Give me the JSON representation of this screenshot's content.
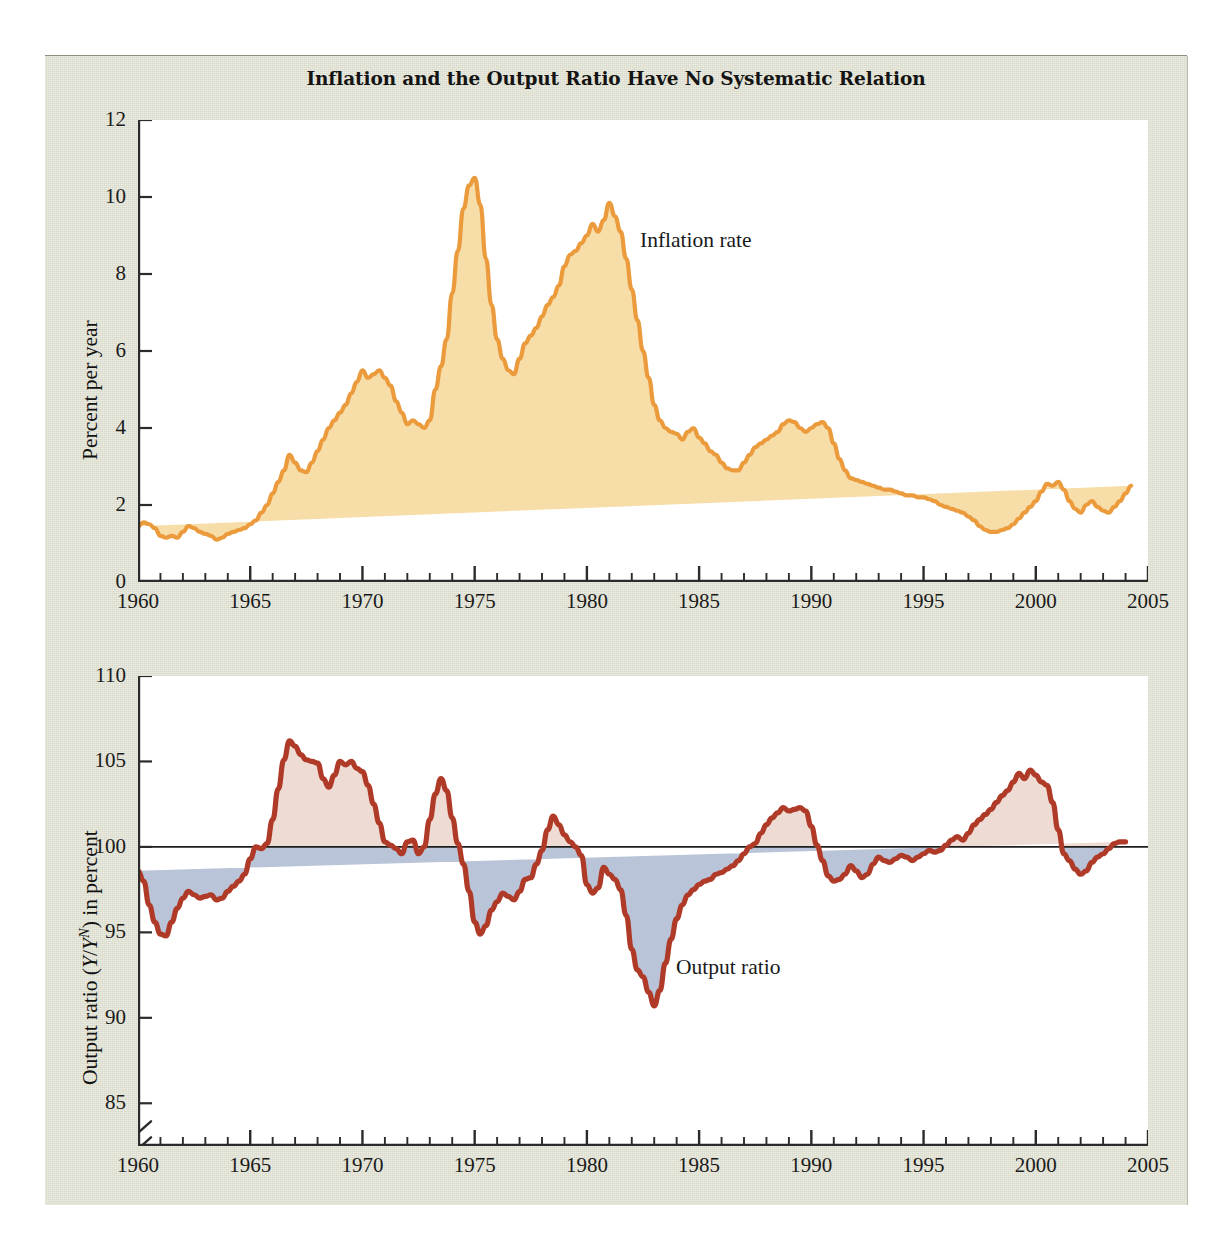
{
  "figure": {
    "title": "Inflation and the Output Ratio Have No Systematic Relation",
    "background_color": "#d9dac9",
    "plot_background_color": "#ffffff"
  },
  "colors": {
    "inflation_line": "#eb9a3c",
    "inflation_fill": "#f7dda8",
    "output_line": "#b03a28",
    "output_fill_above": "#eedcd4",
    "output_fill_below": "#b9c4d8",
    "axis": "#2b2b2b",
    "text": "#141414"
  },
  "chart_data": [
    {
      "type": "area",
      "id": "inflation-panel",
      "title": "Inflation and the Output Ratio Have No Systematic Relation",
      "series_name": "Inflation rate",
      "annotation": "Inflation rate",
      "xlabel": "",
      "ylabel": "Percent per year",
      "xlim": [
        1960,
        2005
      ],
      "ylim": [
        0,
        12
      ],
      "yticks": [
        0,
        2,
        4,
        6,
        8,
        10,
        12
      ],
      "ytick_labels": [
        "0",
        "2",
        "4",
        "6",
        "8",
        "10",
        "12"
      ],
      "xticks": [
        1960,
        1965,
        1970,
        1975,
        1980,
        1985,
        1990,
        1995,
        2000,
        2005
      ],
      "xtick_labels": [
        "1960",
        "1965",
        "1970",
        "1975",
        "1980",
        "1985",
        "1990",
        "1995",
        "2000",
        "2005"
      ],
      "minor_xtick_interval": 1,
      "grid": false,
      "x": [
        1960.0,
        1960.25,
        1960.5,
        1960.75,
        1961.0,
        1961.25,
        1961.5,
        1961.75,
        1962.0,
        1962.25,
        1962.5,
        1962.75,
        1963.0,
        1963.25,
        1963.5,
        1963.75,
        1964.0,
        1964.25,
        1964.5,
        1964.75,
        1965.0,
        1965.25,
        1965.5,
        1965.75,
        1966.0,
        1966.25,
        1966.5,
        1966.75,
        1967.0,
        1967.25,
        1967.5,
        1967.75,
        1968.0,
        1968.25,
        1968.5,
        1968.75,
        1969.0,
        1969.25,
        1969.5,
        1969.75,
        1970.0,
        1970.25,
        1970.5,
        1970.75,
        1971.0,
        1971.25,
        1971.5,
        1971.75,
        1972.0,
        1972.25,
        1972.5,
        1972.75,
        1973.0,
        1973.25,
        1973.5,
        1973.75,
        1974.0,
        1974.25,
        1974.5,
        1974.75,
        1975.0,
        1975.25,
        1975.5,
        1975.75,
        1976.0,
        1976.25,
        1976.5,
        1976.75,
        1977.0,
        1977.25,
        1977.5,
        1977.75,
        1978.0,
        1978.25,
        1978.5,
        1978.75,
        1979.0,
        1979.25,
        1979.5,
        1979.75,
        1980.0,
        1980.25,
        1980.5,
        1980.75,
        1981.0,
        1981.25,
        1981.5,
        1981.75,
        1982.0,
        1982.25,
        1982.5,
        1982.75,
        1983.0,
        1983.25,
        1983.5,
        1983.75,
        1984.0,
        1984.25,
        1984.5,
        1984.75,
        1985.0,
        1985.25,
        1985.5,
        1985.75,
        1986.0,
        1986.25,
        1986.5,
        1986.75,
        1987.0,
        1987.25,
        1987.5,
        1987.75,
        1988.0,
        1988.25,
        1988.5,
        1988.75,
        1989.0,
        1989.25,
        1989.5,
        1989.75,
        1990.0,
        1990.25,
        1990.5,
        1990.75,
        1991.0,
        1991.25,
        1991.5,
        1991.75,
        1992.0,
        1992.25,
        1992.5,
        1992.75,
        1993.0,
        1993.25,
        1993.5,
        1993.75,
        1994.0,
        1994.25,
        1994.5,
        1994.75,
        1995.0,
        1995.25,
        1995.5,
        1995.75,
        1996.0,
        1996.25,
        1996.5,
        1996.75,
        1997.0,
        1997.25,
        1997.5,
        1997.75,
        1998.0,
        1998.25,
        1998.5,
        1998.75,
        1999.0,
        1999.25,
        1999.5,
        1999.75,
        2000.0,
        2000.25,
        2000.5,
        2000.75,
        2001.0,
        2001.25,
        2001.5,
        2001.75,
        2002.0,
        2002.25,
        2002.5,
        2002.75,
        2003.0,
        2003.25,
        2003.5,
        2003.75,
        2004.0,
        2004.25,
        2004.5,
        2004.75
      ],
      "y": [
        1.45,
        1.55,
        1.5,
        1.4,
        1.2,
        1.15,
        1.2,
        1.15,
        1.3,
        1.45,
        1.4,
        1.3,
        1.25,
        1.2,
        1.1,
        1.15,
        1.25,
        1.3,
        1.35,
        1.4,
        1.5,
        1.6,
        1.8,
        2.0,
        2.3,
        2.6,
        2.9,
        3.3,
        3.1,
        2.9,
        2.85,
        3.1,
        3.4,
        3.7,
        4.0,
        4.2,
        4.4,
        4.6,
        4.9,
        5.2,
        5.5,
        5.3,
        5.4,
        5.5,
        5.3,
        5.1,
        4.7,
        4.4,
        4.1,
        4.2,
        4.1,
        4.0,
        4.2,
        5.0,
        5.6,
        6.3,
        7.5,
        8.6,
        9.7,
        10.3,
        10.5,
        9.8,
        8.4,
        7.2,
        6.3,
        5.8,
        5.5,
        5.4,
        5.8,
        6.2,
        6.4,
        6.6,
        6.9,
        7.2,
        7.4,
        7.7,
        8.2,
        8.5,
        8.6,
        8.8,
        9.0,
        9.3,
        9.1,
        9.4,
        9.85,
        9.5,
        9.1,
        8.4,
        7.6,
        6.8,
        6.0,
        5.3,
        4.6,
        4.2,
        4.0,
        3.9,
        3.85,
        3.7,
        3.9,
        4.0,
        3.75,
        3.6,
        3.4,
        3.3,
        3.1,
        2.95,
        2.9,
        2.9,
        3.1,
        3.3,
        3.5,
        3.6,
        3.7,
        3.8,
        3.9,
        4.1,
        4.2,
        4.15,
        4.0,
        3.9,
        4.0,
        4.1,
        4.15,
        4.0,
        3.6,
        3.2,
        2.9,
        2.7,
        2.65,
        2.6,
        2.55,
        2.5,
        2.45,
        2.4,
        2.4,
        2.35,
        2.3,
        2.25,
        2.25,
        2.2,
        2.2,
        2.15,
        2.1,
        2.0,
        1.95,
        1.9,
        1.85,
        1.8,
        1.7,
        1.6,
        1.45,
        1.35,
        1.3,
        1.3,
        1.35,
        1.4,
        1.5,
        1.65,
        1.8,
        1.95,
        2.1,
        2.35,
        2.55,
        2.5,
        2.6,
        2.4,
        2.1,
        1.9,
        1.8,
        2.0,
        2.1,
        1.95,
        1.85,
        1.8,
        1.95,
        2.1,
        2.3,
        2.5
      ]
    },
    {
      "type": "area",
      "id": "output-ratio-panel",
      "series_name": "Output ratio",
      "annotation": "Output ratio",
      "xlabel": "",
      "ylabel": "Output ratio (Y/Yᴺ) in percent",
      "ylabel_plain": "Output ratio (Y/YN) in percent",
      "reference_line": 100,
      "xlim": [
        1960,
        2005
      ],
      "ylim": [
        82.5,
        110
      ],
      "yticks": [
        85,
        90,
        95,
        100,
        105,
        110
      ],
      "ytick_labels": [
        "85",
        "90",
        "95",
        "100",
        "105",
        "110"
      ],
      "axis_break_below": 85,
      "xticks": [
        1960,
        1965,
        1970,
        1975,
        1980,
        1985,
        1990,
        1995,
        2000,
        2005
      ],
      "xtick_labels": [
        "1960",
        "1965",
        "1970",
        "1975",
        "1980",
        "1985",
        "1990",
        "1995",
        "2000",
        "2005"
      ],
      "minor_xtick_interval": 1,
      "grid": false,
      "x": [
        1960.0,
        1960.25,
        1960.5,
        1960.75,
        1961.0,
        1961.25,
        1961.5,
        1961.75,
        1962.0,
        1962.25,
        1962.5,
        1962.75,
        1963.0,
        1963.25,
        1963.5,
        1963.75,
        1964.0,
        1964.25,
        1964.5,
        1964.75,
        1965.0,
        1965.25,
        1965.5,
        1965.75,
        1966.0,
        1966.25,
        1966.5,
        1966.75,
        1967.0,
        1967.25,
        1967.5,
        1967.75,
        1968.0,
        1968.25,
        1968.5,
        1968.75,
        1969.0,
        1969.25,
        1969.5,
        1969.75,
        1970.0,
        1970.25,
        1970.5,
        1970.75,
        1971.0,
        1971.25,
        1971.5,
        1971.75,
        1972.0,
        1972.25,
        1972.5,
        1972.75,
        1973.0,
        1973.25,
        1973.5,
        1973.75,
        1974.0,
        1974.25,
        1974.5,
        1974.75,
        1975.0,
        1975.25,
        1975.5,
        1975.75,
        1976.0,
        1976.25,
        1976.5,
        1976.75,
        1977.0,
        1977.25,
        1977.5,
        1977.75,
        1978.0,
        1978.25,
        1978.5,
        1978.75,
        1979.0,
        1979.25,
        1979.5,
        1979.75,
        1980.0,
        1980.25,
        1980.5,
        1980.75,
        1981.0,
        1981.25,
        1981.5,
        1981.75,
        1982.0,
        1982.25,
        1982.5,
        1982.75,
        1983.0,
        1983.25,
        1983.5,
        1983.75,
        1984.0,
        1984.25,
        1984.5,
        1984.75,
        1985.0,
        1985.25,
        1985.5,
        1985.75,
        1986.0,
        1986.25,
        1986.5,
        1986.75,
        1987.0,
        1987.25,
        1987.5,
        1987.75,
        1988.0,
        1988.25,
        1988.5,
        1988.75,
        1989.0,
        1989.25,
        1989.5,
        1989.75,
        1990.0,
        1990.25,
        1990.5,
        1990.75,
        1991.0,
        1991.25,
        1991.5,
        1991.75,
        1992.0,
        1992.25,
        1992.5,
        1992.75,
        1993.0,
        1993.25,
        1993.5,
        1993.75,
        1994.0,
        1994.25,
        1994.5,
        1994.75,
        1995.0,
        1995.25,
        1995.5,
        1995.75,
        1996.0,
        1996.25,
        1996.5,
        1996.75,
        1997.0,
        1997.25,
        1997.5,
        1997.75,
        1998.0,
        1998.25,
        1998.5,
        1998.75,
        1999.0,
        1999.25,
        1999.5,
        1999.75,
        2000.0,
        2000.25,
        2000.5,
        2000.75,
        2001.0,
        2001.25,
        2001.5,
        2001.75,
        2002.0,
        2002.25,
        2002.5,
        2002.75,
        2003.0,
        2003.25,
        2003.5,
        2003.75,
        2004.0,
        2004.25,
        2004.5,
        2004.75
      ],
      "y": [
        98.6,
        98.0,
        96.6,
        95.6,
        94.9,
        94.8,
        95.6,
        96.4,
        97.0,
        97.4,
        97.2,
        97.0,
        97.1,
        97.2,
        96.9,
        97.0,
        97.4,
        97.7,
        98.0,
        98.4,
        99.3,
        100.0,
        99.9,
        100.2,
        101.6,
        103.4,
        105.1,
        106.2,
        105.9,
        105.4,
        105.1,
        105.0,
        104.9,
        104.0,
        103.5,
        104.2,
        105.0,
        104.8,
        105.0,
        104.6,
        104.4,
        103.6,
        102.5,
        101.4,
        100.3,
        100.1,
        99.9,
        99.6,
        100.3,
        100.4,
        99.6,
        100.0,
        101.6,
        103.1,
        104.0,
        103.3,
        101.7,
        100.2,
        99.0,
        97.4,
        95.6,
        94.9,
        95.4,
        96.3,
        96.8,
        97.3,
        97.1,
        96.9,
        97.4,
        98.1,
        98.2,
        99.0,
        99.8,
        101.0,
        101.8,
        101.3,
        100.7,
        100.3,
        100.0,
        99.5,
        97.8,
        97.3,
        97.6,
        98.8,
        98.4,
        98.1,
        97.5,
        96.0,
        94.0,
        92.8,
        92.4,
        91.5,
        90.7,
        91.6,
        93.2,
        94.6,
        95.8,
        96.6,
        97.2,
        97.5,
        97.8,
        98.0,
        98.1,
        98.4,
        98.5,
        98.7,
        98.9,
        99.2,
        99.6,
        100.0,
        100.2,
        100.8,
        101.3,
        101.7,
        102.0,
        102.3,
        102.1,
        102.2,
        102.3,
        102.1,
        101.2,
        100.1,
        99.2,
        98.3,
        98.0,
        98.1,
        98.4,
        98.9,
        98.6,
        98.2,
        98.4,
        99.0,
        99.4,
        99.2,
        99.1,
        99.3,
        99.5,
        99.4,
        99.2,
        99.4,
        99.6,
        99.8,
        99.7,
        99.8,
        100.1,
        100.4,
        100.6,
        100.4,
        100.8,
        101.3,
        101.6,
        101.9,
        102.2,
        102.6,
        103.0,
        103.3,
        103.8,
        104.3,
        104.0,
        104.5,
        104.2,
        103.8,
        103.6,
        102.6,
        101.0,
        99.6,
        99.2,
        98.7,
        98.4,
        98.6,
        99.1,
        99.4,
        99.6,
        99.9,
        100.2,
        100.3,
        100.3
      ]
    }
  ]
}
